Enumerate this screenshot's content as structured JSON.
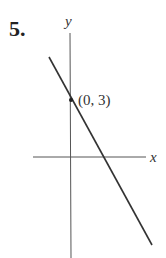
{
  "problem": {
    "number": "5."
  },
  "axes": {
    "x_label": "x",
    "y_label": "y"
  },
  "point": {
    "label": "(0, 3)",
    "x": 0,
    "y": 3
  },
  "line": {
    "description": "line with negative slope through (0, 3)",
    "color": "#333333"
  }
}
